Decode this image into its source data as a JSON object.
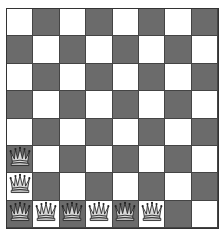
{
  "board": {
    "files": [
      "a",
      "b",
      "c",
      "d",
      "e",
      "f",
      "g",
      "h"
    ],
    "ranks": [
      8,
      7,
      6,
      5,
      4,
      3,
      2,
      1
    ],
    "top_left_color": "light",
    "colors": {
      "light": "#ffffff",
      "dark": "#6b6b6b"
    },
    "pieces": [
      {
        "square": "a3",
        "type": "queen",
        "color": "white"
      },
      {
        "square": "a2",
        "type": "queen",
        "color": "white"
      },
      {
        "square": "a1",
        "type": "queen",
        "color": "white"
      },
      {
        "square": "b1",
        "type": "queen",
        "color": "white"
      },
      {
        "square": "c1",
        "type": "queen",
        "color": "white"
      },
      {
        "square": "d1",
        "type": "queen",
        "color": "white"
      },
      {
        "square": "e1",
        "type": "queen",
        "color": "white"
      },
      {
        "square": "f1",
        "type": "queen",
        "color": "white"
      }
    ]
  }
}
